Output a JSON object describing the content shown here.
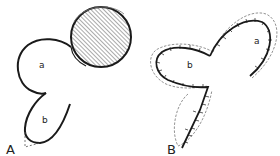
{
  "panels": [
    {
      "id": "A",
      "label": "A",
      "regions": [
        {
          "id": "a",
          "label": "a"
        },
        {
          "id": "b",
          "label": "b"
        }
      ],
      "elements": [
        "hatched-circle",
        "flap-outline",
        "dashed-triangle"
      ]
    },
    {
      "id": "B",
      "label": "B",
      "regions": [
        {
          "id": "a",
          "label": "a"
        },
        {
          "id": "b",
          "label": "b"
        }
      ],
      "elements": [
        "sutured-flap-outline",
        "dashed-outline",
        "suture-line"
      ]
    }
  ],
  "colors": {
    "stroke": "#1a1a1a",
    "hatch": "#555555",
    "background": "#ffffff"
  }
}
